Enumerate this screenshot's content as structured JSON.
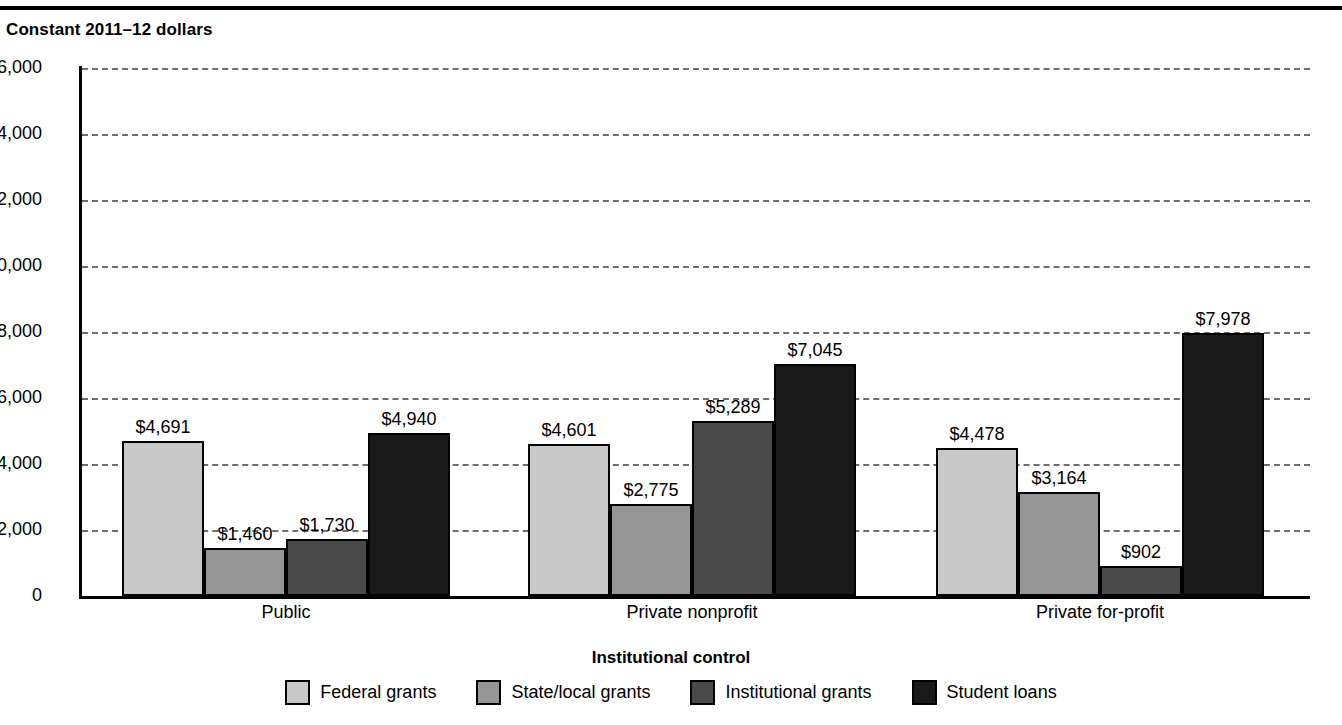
{
  "header": {
    "axis_unit_label": "Constant 2011–12 dollars"
  },
  "chart_data": {
    "type": "bar",
    "title": "Constant 2011–12 dollars",
    "xlabel": "Institutional control",
    "ylabel": "",
    "ylim": [
      0,
      16000
    ],
    "grid": true,
    "legend_position": "bottom",
    "categories": [
      "Public",
      "Private nonprofit",
      "Private for-profit"
    ],
    "ytick_labels": [
      "$16,000",
      "14,000",
      "12,000",
      "10,000",
      "8,000",
      "6,000",
      "4,000",
      "2,000",
      "0"
    ],
    "ytick_values": [
      16000,
      14000,
      12000,
      10000,
      8000,
      6000,
      4000,
      2000,
      0
    ],
    "series": [
      {
        "name": "Federal grants",
        "color": "#c8c8c8",
        "values": [
          4691,
          4601,
          4478
        ],
        "labels": [
          "$4,691",
          "$4,601",
          "$4,478"
        ]
      },
      {
        "name": "State/local grants",
        "color": "#969696",
        "values": [
          1460,
          2775,
          3164
        ],
        "labels": [
          "$1,460",
          "$2,775",
          "$3,164"
        ]
      },
      {
        "name": "Institutional grants",
        "color": "#4a4a4a",
        "values": [
          1730,
          5289,
          902
        ],
        "labels": [
          "$1,730",
          "$5,289",
          "$902"
        ]
      },
      {
        "name": "Student loans",
        "color": "#1a1a1a",
        "values": [
          4940,
          7045,
          7978
        ],
        "labels": [
          "$4,940",
          "$7,045",
          "$7,978"
        ]
      }
    ]
  }
}
